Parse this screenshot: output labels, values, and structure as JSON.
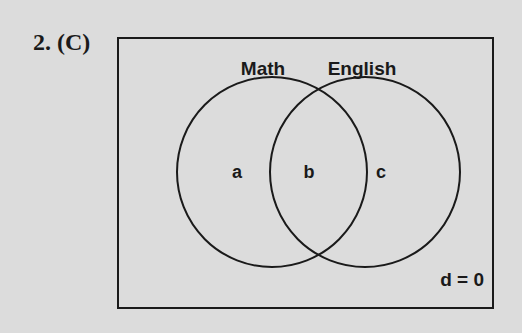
{
  "question": {
    "number": "2.",
    "answer": "(C)"
  },
  "diagram": {
    "type": "venn",
    "sets": [
      {
        "name": "Math",
        "region_label": "a"
      },
      {
        "name": "English",
        "region_label": "c"
      }
    ],
    "intersection_label": "b",
    "outside_label": "d = 0"
  }
}
